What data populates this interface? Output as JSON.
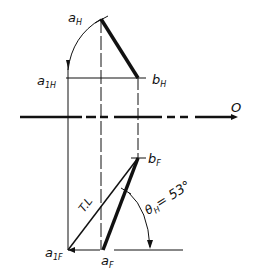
{
  "diagram": {
    "labels": {
      "a_h": "a",
      "a_h_sub": "H",
      "b_h": "b",
      "b_h_sub": "H",
      "a1_h": "a",
      "a1_h_sub": "1H",
      "axis": "O",
      "b_f": "b",
      "b_f_sub": "F",
      "a_f": "a",
      "a_f_sub": "F",
      "a1_f": "a",
      "a1_f_sub": "1F",
      "true_length": "T.L",
      "angle": "θ",
      "angle_sub": "H",
      "angle_value": "= 53°"
    },
    "points": {
      "a_H": [
        101,
        19
      ],
      "b_H": [
        138,
        78
      ],
      "a_1H": [
        68,
        78
      ],
      "b_F": [
        138,
        158
      ],
      "a_F": [
        103,
        250
      ],
      "a_1F": [
        68,
        250
      ]
    },
    "angle_deg": 53,
    "colors": {
      "ink": "#111111",
      "background": "#ffffff"
    }
  }
}
